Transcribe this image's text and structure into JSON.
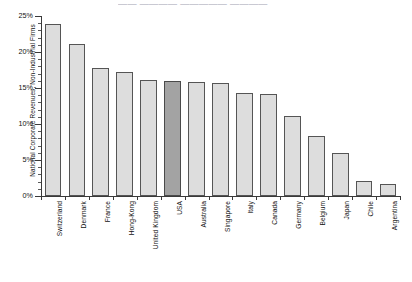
{
  "top_title": "—— ———— ————— ————",
  "chart_data": {
    "type": "bar",
    "title": "",
    "xlabel": "",
    "ylabel": "National Corporate Revenues, Non-Industrial Firms",
    "ylim": [
      0,
      25
    ],
    "ytick_labels": [
      "0%",
      "5%",
      "10%",
      "15%",
      "20%",
      "25%"
    ],
    "ytick_values": [
      0,
      5,
      10,
      15,
      20,
      25
    ],
    "grid": false,
    "legend": "none",
    "highlight_category": "USA",
    "colors": {
      "bar_fill": "#dddddd",
      "bar_edge": "#555555",
      "highlight_fill": "#a3a3a3",
      "highlight_edge": "#4a4a4a",
      "axis": "#3a3a3a",
      "text": "#111111",
      "background": "#ffffff"
    },
    "categories": [
      "Switzerland",
      "Denmark",
      "France",
      "Hong-Kong",
      "United Kingdom",
      "USA",
      "Australia",
      "Singapore",
      "Italy",
      "Canada",
      "Germany",
      "Belgium",
      "Japan",
      "Chile",
      "Argentina"
    ],
    "values": [
      23.9,
      21.1,
      17.8,
      17.2,
      16.1,
      16.0,
      15.9,
      15.7,
      14.3,
      14.2,
      11.1,
      8.3,
      6.0,
      2.1,
      1.7
    ]
  }
}
